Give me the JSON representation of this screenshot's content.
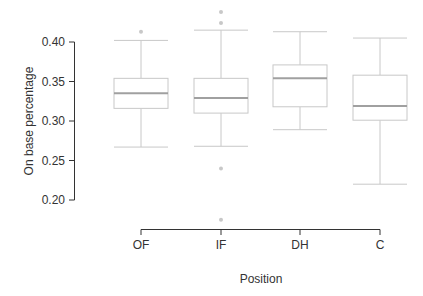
{
  "chart_data": {
    "type": "box",
    "title": "",
    "xlabel": "Position",
    "ylabel": "On base percentage",
    "categories": [
      "OF",
      "IF",
      "DH",
      "C"
    ],
    "yticks": [
      0.2,
      0.25,
      0.3,
      0.35,
      0.4
    ],
    "ytick_labels": [
      "0.20",
      "0.25",
      "0.30",
      "0.35",
      "0.40"
    ],
    "ylim": [
      0.2,
      0.4
    ],
    "grid": false,
    "legend": null,
    "boxes": [
      {
        "category": "OF",
        "whisker_low": 0.267,
        "q1": 0.316,
        "median": 0.335,
        "q3": 0.354,
        "whisker_high": 0.402,
        "outliers": [
          0.413
        ]
      },
      {
        "category": "IF",
        "whisker_low": 0.268,
        "q1": 0.31,
        "median": 0.329,
        "q3": 0.354,
        "whisker_high": 0.415,
        "outliers": [
          0.438,
          0.424,
          0.24,
          0.175
        ]
      },
      {
        "category": "DH",
        "whisker_low": 0.289,
        "q1": 0.318,
        "median": 0.354,
        "q3": 0.371,
        "whisker_high": 0.413,
        "outliers": []
      },
      {
        "category": "C",
        "whisker_low": 0.22,
        "q1": 0.301,
        "median": 0.319,
        "q3": 0.358,
        "whisker_high": 0.405,
        "outliers": []
      }
    ]
  },
  "style": {
    "box_color": "#c8c8c8",
    "median_color": "#a0a0a0",
    "axis_color": "#333333",
    "outlier_color": "#c8c8c8"
  }
}
